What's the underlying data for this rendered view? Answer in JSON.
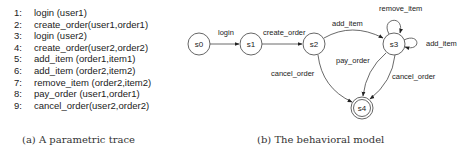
{
  "trace": {
    "lines": [
      {
        "num": "1:",
        "text": "login (user1)"
      },
      {
        "num": "2:",
        "text": "create_order(user1,order1)"
      },
      {
        "num": "3:",
        "text": "login (user2)"
      },
      {
        "num": "4:",
        "text": "create_order(user2,order2)"
      },
      {
        "num": "5:",
        "text": "add_item (order1,item1)"
      },
      {
        "num": "6:",
        "text": "add_item (order2,item2)"
      },
      {
        "num": "7:",
        "text": "remove_item (order2,item2)"
      },
      {
        "num": "8:",
        "text": "pay_order (user1,order1)"
      },
      {
        "num": "9:",
        "text": "cancel_order(user2,order2)"
      }
    ],
    "caption": "(a) A parametric trace"
  },
  "model": {
    "caption": "(b) The behavioral model",
    "states": [
      {
        "id": "s0",
        "label": "s0",
        "accepting": false
      },
      {
        "id": "s1",
        "label": "s1",
        "accepting": false
      },
      {
        "id": "s2",
        "label": "s2",
        "accepting": false
      },
      {
        "id": "s3",
        "label": "s3",
        "accepting": false
      },
      {
        "id": "s4",
        "label": "s4",
        "accepting": true
      }
    ],
    "transitions": [
      {
        "from": "s0",
        "to": "s1",
        "label": "login"
      },
      {
        "from": "s1",
        "to": "s2",
        "label": "create_order"
      },
      {
        "from": "s2",
        "to": "s3",
        "label": "add_item"
      },
      {
        "from": "s3",
        "to": "s3",
        "label": "remove_item"
      },
      {
        "from": "s3",
        "to": "s3",
        "label": "add_item"
      },
      {
        "from": "s2",
        "to": "s4",
        "label": "cancel_order"
      },
      {
        "from": "s3",
        "to": "s4",
        "label": "pay_order"
      },
      {
        "from": "s3",
        "to": "s4",
        "label": "cancel_order"
      }
    ]
  }
}
